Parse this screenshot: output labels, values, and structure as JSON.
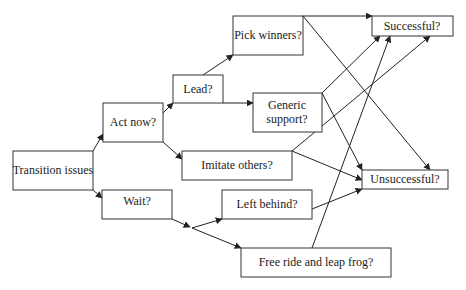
{
  "diagram": {
    "type": "flowchart",
    "nodes": {
      "transition": {
        "label": "Transition issues",
        "x": 13,
        "y": 151,
        "w": 80,
        "h": 39
      },
      "act_now": {
        "label": "Act now?",
        "x": 103,
        "y": 103,
        "w": 60,
        "h": 39
      },
      "lead": {
        "label": "Lead?",
        "x": 173,
        "y": 75,
        "w": 50,
        "h": 28
      },
      "pick_winners": {
        "label": "Pick winners?",
        "x": 233,
        "y": 16,
        "w": 70,
        "h": 39
      },
      "successful": {
        "label": "Successful?",
        "x": 372,
        "y": 16,
        "w": 81,
        "h": 20
      },
      "generic_support": {
        "label_line1": "Generic",
        "label_line2": "support?",
        "x": 253,
        "y": 93,
        "w": 69,
        "h": 39
      },
      "imitate_others": {
        "label": "Imitate others?",
        "x": 182,
        "y": 151,
        "w": 110,
        "h": 29
      },
      "unsuccessful": {
        "label": "Unsuccessful?",
        "x": 362,
        "y": 170,
        "w": 86,
        "h": 19
      },
      "wait": {
        "label": "Wait?",
        "x": 102,
        "y": 190,
        "w": 70,
        "h": 29
      },
      "left_behind": {
        "label": "Left behind?",
        "x": 222,
        "y": 190,
        "w": 90,
        "h": 29
      },
      "free_ride": {
        "label": "Free ride and leap frog?",
        "x": 241,
        "y": 248,
        "w": 150,
        "h": 29
      }
    },
    "edges": [
      {
        "from": "Transition issues",
        "to": "Act now?"
      },
      {
        "from": "Transition issues",
        "to": "Wait?"
      },
      {
        "from": "Act now?",
        "to": "Lead?"
      },
      {
        "from": "Act now?",
        "to": "Imitate others?"
      },
      {
        "from": "Lead?",
        "to": "Pick winners?"
      },
      {
        "from": "Lead?",
        "to": "Generic support?"
      },
      {
        "from": "Pick winners?",
        "to": "Successful?"
      },
      {
        "from": "Pick winners?",
        "to": "Unsuccessful?"
      },
      {
        "from": "Generic support?",
        "to": "Successful?"
      },
      {
        "from": "Generic support?",
        "to": "Unsuccessful?"
      },
      {
        "from": "Imitate others?",
        "to": "Successful?"
      },
      {
        "from": "Imitate others?",
        "to": "Unsuccessful?"
      },
      {
        "from": "Wait?",
        "to": "Left behind?"
      },
      {
        "from": "Wait?",
        "to": "Free ride and leap frog?"
      },
      {
        "from": "Left behind?",
        "to": "Unsuccessful?"
      },
      {
        "from": "Free ride and leap frog?",
        "to": "Successful?"
      }
    ],
    "colors": {
      "stroke": "#333333",
      "text": "#222222",
      "background": "#ffffff"
    }
  }
}
